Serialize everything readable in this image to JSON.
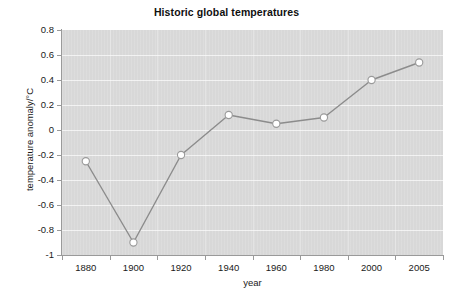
{
  "chart_data": {
    "type": "line",
    "title": "Historic global temperatures",
    "xlabel": "year",
    "ylabel": "temperature anomaly/°C",
    "categories": [
      "1880",
      "1900",
      "1920",
      "1940",
      "1960",
      "1980",
      "2000",
      "2005"
    ],
    "values": [
      -0.25,
      -0.9,
      -0.2,
      0.12,
      0.05,
      0.1,
      0.4,
      0.54
    ],
    "series": [
      {
        "name": "temperature anomaly",
        "values": [
          -0.25,
          -0.9,
          -0.2,
          0.12,
          0.05,
          0.1,
          0.4,
          0.54
        ]
      }
    ],
    "ylim": [
      -1,
      0.8
    ],
    "yticks": [
      "0.8",
      "0.6",
      "0.4",
      "0.2",
      "0",
      "-0.2",
      "-0.4",
      "-0.6",
      "-0.8",
      "-1"
    ],
    "ytick_values": [
      0.8,
      0.6,
      0.4,
      0.2,
      0,
      -0.2,
      -0.4,
      -0.6,
      -0.8,
      -1
    ],
    "xticks": [
      "1880",
      "1900",
      "1920",
      "1940",
      "1960",
      "1980",
      "2000",
      "2005"
    ],
    "grid": "horizontal",
    "legend": "none",
    "colors": {
      "plot_background": "#d8d8d8",
      "gridline": "#f2f2f2",
      "line": "#8c8c8c",
      "marker_fill": "#ffffff",
      "marker_stroke": "#9a9a9a",
      "axis": "#9a9a9a",
      "text": "#1a1a1a",
      "figure_background": "#ffffff"
    }
  }
}
